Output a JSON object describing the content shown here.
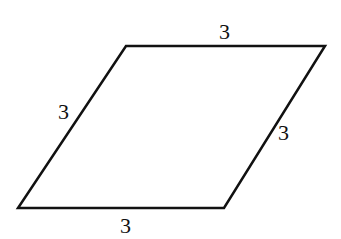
{
  "diagram": {
    "type": "rhombus",
    "stroke_color": "#111111",
    "vertices": [
      [
        126,
        46
      ],
      [
        325,
        46
      ],
      [
        224,
        208
      ],
      [
        18,
        208
      ]
    ],
    "labels": {
      "top": "3",
      "left": "3",
      "right": "3",
      "bottom": "3"
    }
  }
}
